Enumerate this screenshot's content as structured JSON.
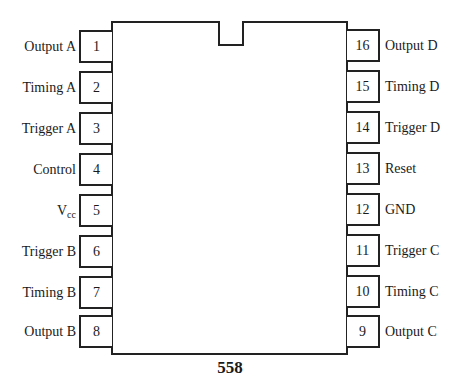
{
  "diagram": {
    "part_number": "558",
    "left_pins": [
      {
        "number": "1",
        "label": "Output A"
      },
      {
        "number": "2",
        "label": "Timing A"
      },
      {
        "number": "3",
        "label": "Trigger A"
      },
      {
        "number": "4",
        "label": "Control"
      },
      {
        "number": "5",
        "label": "V",
        "label_sub": "cc"
      },
      {
        "number": "6",
        "label": "Trigger B"
      },
      {
        "number": "7",
        "label": "Timing B"
      },
      {
        "number": "8",
        "label": "Output B"
      }
    ],
    "right_pins": [
      {
        "number": "16",
        "label": "Output D"
      },
      {
        "number": "15",
        "label": "Timing D"
      },
      {
        "number": "14",
        "label": "Trigger D"
      },
      {
        "number": "13",
        "label": "Reset"
      },
      {
        "number": "12",
        "label": "GND"
      },
      {
        "number": "11",
        "label": "Trigger C"
      },
      {
        "number": "10",
        "label": "Timing C"
      },
      {
        "number": "9",
        "label": "Output C"
      }
    ]
  }
}
